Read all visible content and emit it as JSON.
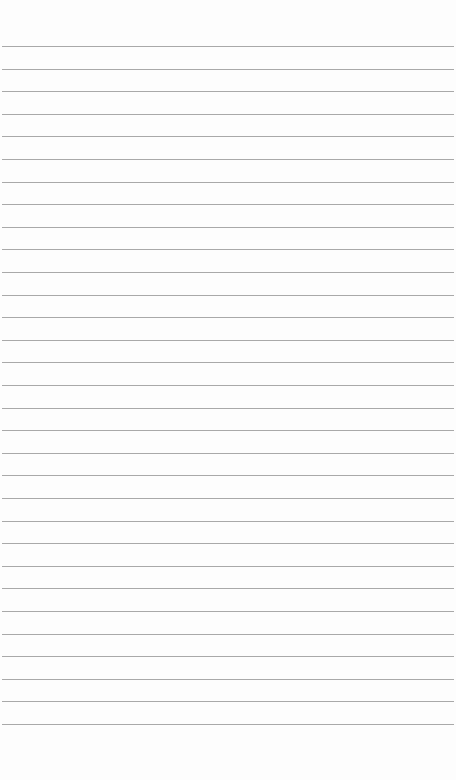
{
  "paper": {
    "type": "lined-paper",
    "background_color": "#fdfdfd",
    "line_color": "#a9a9a9",
    "line_count": 31,
    "first_line_y": 46,
    "line_spacing": 22.6
  }
}
